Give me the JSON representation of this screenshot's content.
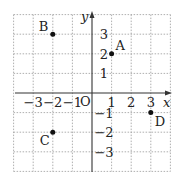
{
  "diagram": {
    "type": "coordinate-plane",
    "axes": {
      "x_label": "x",
      "y_label": "y",
      "origin_label": "O"
    },
    "x_ticks": [
      {
        "value": -3,
        "label": "−3"
      },
      {
        "value": -2,
        "label": "−2"
      },
      {
        "value": -1,
        "label": "−1"
      },
      {
        "value": 1,
        "label": "1"
      },
      {
        "value": 2,
        "label": "2"
      },
      {
        "value": 3,
        "label": "3"
      }
    ],
    "y_ticks": [
      {
        "value": 3,
        "label": "3"
      },
      {
        "value": 2,
        "label": "2"
      },
      {
        "value": 1,
        "label": "1"
      },
      {
        "value": -1,
        "label": "−1"
      },
      {
        "value": -2,
        "label": "−2"
      },
      {
        "value": -3,
        "label": "−3"
      }
    ],
    "points": [
      {
        "name": "A",
        "x": 1,
        "y": 2
      },
      {
        "name": "B",
        "x": -2,
        "y": 3
      },
      {
        "name": "C",
        "x": -2,
        "y": -2
      },
      {
        "name": "D",
        "x": 3,
        "y": -1
      }
    ],
    "grid_range": {
      "xmin": -4,
      "xmax": 4,
      "ymin": -4,
      "ymax": 4
    },
    "colors": {
      "grid": "#9a9a9a",
      "axis": "#333333",
      "point": "#111111"
    }
  }
}
